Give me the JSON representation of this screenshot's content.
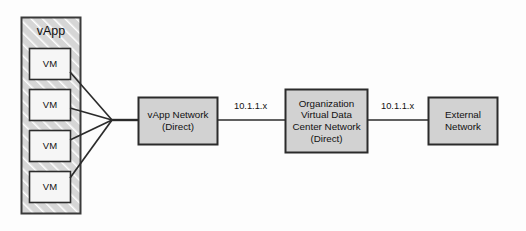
{
  "diagram": {
    "type": "network-topology",
    "colors": {
      "container_fill": "#d6d6d6",
      "container_stroke": "#3a3a3a",
      "hatch_stroke": "#ffffff",
      "node_fill": "#d2d2d2",
      "vm_fill": "#f5f5f5",
      "node_stroke": "#2b2b2b",
      "line_stroke": "#2b2b2b",
      "text": "#111111",
      "background": "#fdfdfd"
    },
    "container": {
      "label": "vApp",
      "fill_pattern": "diagonal-hatch"
    },
    "vms": [
      {
        "label": "VM"
      },
      {
        "label": "VM"
      },
      {
        "label": "VM"
      },
      {
        "label": "VM"
      }
    ],
    "nodes": [
      {
        "id": "vapp-network",
        "lines": [
          "vApp Network",
          "(Direct)"
        ]
      },
      {
        "id": "org-vdc-network",
        "lines": [
          "Organization",
          "Virtual Data",
          "Center Network",
          "(Direct)"
        ]
      },
      {
        "id": "external-network",
        "lines": [
          "External",
          "Network"
        ]
      }
    ],
    "links": [
      {
        "from": "vapp-network",
        "to": "org-vdc-network",
        "label": "10.1.1.x"
      },
      {
        "from": "org-vdc-network",
        "to": "external-network",
        "label": "10.1.1.x"
      }
    ]
  }
}
